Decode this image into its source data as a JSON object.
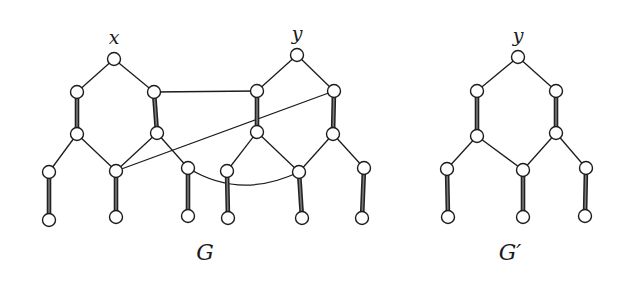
{
  "figure": {
    "graphs": [
      {
        "id": "G",
        "label": "G",
        "label_pos": [
          205,
          253
        ],
        "node_labels": [
          {
            "text": "x",
            "pos": [
              114,
              44
            ]
          },
          {
            "text": "y",
            "pos": [
              297,
              40
            ]
          }
        ],
        "nodes": {
          "x": [
            114,
            59
          ],
          "a1": [
            77,
            92
          ],
          "a2": [
            77,
            134
          ],
          "b1": [
            154,
            92
          ],
          "b2": [
            157,
            133
          ],
          "c1": [
            49,
            172
          ],
          "c2": [
            49,
            220
          ],
          "d1": [
            116,
            171
          ],
          "d2": [
            116,
            217
          ],
          "e1": [
            188,
            168
          ],
          "e2": [
            188,
            216
          ],
          "y": [
            297,
            55
          ],
          "f1": [
            257,
            91
          ],
          "f2": [
            257,
            132
          ],
          "g1": [
            334,
            91
          ],
          "g2": [
            333,
            134
          ],
          "h1": [
            227,
            171
          ],
          "h2": [
            228,
            218
          ],
          "i1": [
            299,
            172
          ],
          "i2": [
            302,
            218
          ],
          "j1": [
            364,
            168
          ],
          "j2": [
            362,
            218
          ]
        },
        "thin_edges": [
          [
            "x",
            "a1"
          ],
          [
            "x",
            "b1"
          ],
          [
            "a2",
            "c1"
          ],
          [
            "a2",
            "d1"
          ],
          [
            "b2",
            "d1"
          ],
          [
            "b2",
            "e1"
          ],
          [
            "y",
            "f1"
          ],
          [
            "y",
            "g1"
          ],
          [
            "f2",
            "h1"
          ],
          [
            "f2",
            "i1"
          ],
          [
            "g2",
            "i1"
          ],
          [
            "g2",
            "j1"
          ],
          [
            "b1",
            "f1"
          ],
          [
            "d1",
            "g1"
          ]
        ],
        "thick_edges": [
          [
            "a1",
            "a2"
          ],
          [
            "b1",
            "b2"
          ],
          [
            "c1",
            "c2"
          ],
          [
            "d1",
            "d2"
          ],
          [
            "e1",
            "e2"
          ],
          [
            "f1",
            "f2"
          ],
          [
            "g1",
            "g2"
          ],
          [
            "h1",
            "h2"
          ],
          [
            "i1",
            "i2"
          ],
          [
            "j1",
            "j2"
          ]
        ],
        "curved_edges": [
          {
            "from": "e1",
            "to": "i1",
            "ctrl": [
              240,
              200
            ]
          }
        ]
      },
      {
        "id": "G_prime",
        "label": "G′",
        "label_pos": [
          508,
          253
        ],
        "node_labels": [
          {
            "text": "y",
            "pos": [
              518,
              42
            ]
          }
        ],
        "nodes": {
          "y": [
            518,
            57
          ],
          "a1": [
            477,
            91
          ],
          "a2": [
            477,
            136
          ],
          "b1": [
            556,
            91
          ],
          "b2": [
            556,
            133
          ],
          "c1": [
            447,
            169
          ],
          "c2": [
            448,
            217
          ],
          "d1": [
            523,
            170
          ],
          "d2": [
            523,
            217
          ],
          "e1": [
            586,
            168
          ],
          "e2": [
            585,
            216
          ]
        },
        "thin_edges": [
          [
            "y",
            "a1"
          ],
          [
            "y",
            "b1"
          ],
          [
            "a2",
            "c1"
          ],
          [
            "a2",
            "d1"
          ],
          [
            "b2",
            "d1"
          ],
          [
            "b2",
            "e1"
          ]
        ],
        "thick_edges": [
          [
            "a1",
            "a2"
          ],
          [
            "b1",
            "b2"
          ],
          [
            "c1",
            "c2"
          ],
          [
            "d1",
            "d2"
          ],
          [
            "e1",
            "e2"
          ]
        ],
        "curved_edges": []
      }
    ],
    "style": {
      "node_radius": 6.5,
      "background": "#ffffff",
      "ink": "#1c1c1c",
      "thick_fill": "#7a7a7a"
    }
  }
}
